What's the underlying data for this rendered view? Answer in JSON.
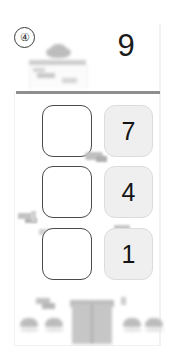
{
  "screen": {
    "width": 173,
    "height": 352,
    "background": "#ffffff"
  },
  "question": {
    "index_label": "④",
    "prompt_number": "9"
  },
  "header": {
    "obscured": true,
    "obscured_label": "blurred-header-card"
  },
  "divider": {
    "color": "#8e8e8e"
  },
  "rows": [
    {
      "answer_box_value": "",
      "answer_box_placeholder": "",
      "number_tile": "7"
    },
    {
      "answer_box_value": "",
      "answer_box_placeholder": "",
      "number_tile": "4"
    },
    {
      "answer_box_value": "",
      "answer_box_placeholder": "",
      "number_tile": "1"
    }
  ],
  "bottom_nav": {
    "obscured": true,
    "obscured_label": "blurred-bottom-navigation"
  },
  "colors": {
    "tile_fill": "#efefef",
    "tile_border": "#dcdcdc",
    "box_border": "#4b4b4b",
    "text": "#141414",
    "blur_grey": "#c3c3c3"
  }
}
